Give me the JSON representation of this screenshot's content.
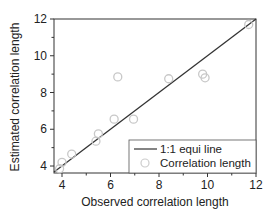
{
  "chart_data": {
    "type": "scatter",
    "title": "",
    "xlabel": "Observed correlation length",
    "ylabel": "Estimated correlation length",
    "xlim": [
      3.67,
      12
    ],
    "ylim": [
      3.62,
      12
    ],
    "xticks": [
      4,
      6,
      8,
      10,
      12
    ],
    "yticks": [
      4,
      6,
      8,
      10,
      12
    ],
    "grid": false,
    "legend_position": "lower right",
    "series": [
      {
        "name": "1:1 equi line",
        "type": "line",
        "color": "#333333",
        "x": [
          3.67,
          12
        ],
        "y": [
          3.67,
          12
        ]
      },
      {
        "name": "Correlation length",
        "type": "scatter",
        "marker": "open-circle",
        "color": "#c8c8c8",
        "x": [
          3.9,
          4.0,
          4.4,
          5.4,
          5.5,
          6.15,
          6.3,
          6.95,
          8.4,
          9.8,
          9.9,
          11.7
        ],
        "y": [
          3.85,
          4.2,
          4.65,
          5.35,
          5.75,
          6.55,
          8.85,
          6.55,
          8.75,
          9.0,
          8.8,
          11.7
        ]
      }
    ]
  },
  "legend": {
    "line_label": "1:1 equi line",
    "scatter_label": "Correlation length"
  },
  "axes": {
    "x_label": "Observed correlation length",
    "y_label": "Estimated correlation length",
    "x_tick_labels": [
      "4",
      "6",
      "8",
      "10",
      "12"
    ],
    "y_tick_labels": [
      "4",
      "6",
      "8",
      "10",
      "12"
    ]
  }
}
